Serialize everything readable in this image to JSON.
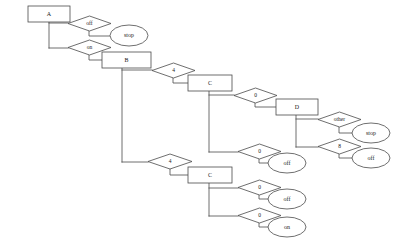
{
  "diagram": {
    "background_color": "#ffffff",
    "stroke_color": "#4a4a4a",
    "text_color": "#1a1a1a",
    "nodes": [
      {
        "id": "n1",
        "name": "process-box-a",
        "shape": "rect",
        "label": "A",
        "x": 28,
        "y": 6,
        "w": 42,
        "h": 16
      },
      {
        "id": "n2",
        "name": "decision-off-1",
        "shape": "diamond",
        "label": "off",
        "x": 68,
        "y": 16,
        "w": 43,
        "h": 15
      },
      {
        "id": "n3",
        "name": "terminal-stop-1",
        "shape": "ellipse",
        "label": "stop",
        "x": 110,
        "y": 25,
        "w": 38,
        "h": 21
      },
      {
        "id": "n4",
        "name": "decision-on-1",
        "shape": "diamond",
        "label": "on",
        "x": 68,
        "y": 40,
        "w": 43,
        "h": 15
      },
      {
        "id": "n5",
        "name": "process-box-b",
        "shape": "rect",
        "label": "B",
        "x": 102,
        "y": 52,
        "w": 49,
        "h": 16
      },
      {
        "id": "n6",
        "name": "decision-4-upper",
        "shape": "diamond",
        "label": "4",
        "x": 152,
        "y": 63,
        "w": 43,
        "h": 15
      },
      {
        "id": "n7",
        "name": "process-box-c-upper",
        "shape": "rect",
        "label": "C",
        "x": 188,
        "y": 75,
        "w": 44,
        "h": 16
      },
      {
        "id": "n8",
        "name": "decision-zero-upper",
        "shape": "diamond",
        "label": "0",
        "x": 234,
        "y": 88,
        "w": 43,
        "h": 15
      },
      {
        "id": "n9",
        "name": "process-box-d",
        "shape": "rect",
        "label": "D",
        "x": 276,
        "y": 99,
        "w": 42,
        "h": 16
      },
      {
        "id": "n10",
        "name": "decision-other",
        "shape": "diamond",
        "label": "other",
        "x": 318,
        "y": 112,
        "w": 43,
        "h": 15
      },
      {
        "id": "n11",
        "name": "terminal-stop-2",
        "shape": "ellipse",
        "label": "stop",
        "x": 352,
        "y": 123,
        "w": 38,
        "h": 20
      },
      {
        "id": "n12",
        "name": "decision-8",
        "shape": "diamond",
        "label": "8",
        "x": 318,
        "y": 139,
        "w": 43,
        "h": 15
      },
      {
        "id": "n13",
        "name": "terminal-off-1",
        "shape": "ellipse",
        "label": "off",
        "x": 352,
        "y": 148,
        "w": 38,
        "h": 20
      },
      {
        "id": "n14",
        "name": "decision-zero-mid",
        "shape": "diamond",
        "label": "0",
        "x": 238,
        "y": 144,
        "w": 43,
        "h": 15
      },
      {
        "id": "n15",
        "name": "terminal-off-2",
        "shape": "ellipse",
        "label": "off",
        "x": 268,
        "y": 153,
        "w": 38,
        "h": 20
      },
      {
        "id": "n16",
        "name": "decision-4-lower",
        "shape": "diamond",
        "label": "4",
        "x": 148,
        "y": 154,
        "w": 44,
        "h": 15
      },
      {
        "id": "n17",
        "name": "process-box-c-lower",
        "shape": "rect",
        "label": "C",
        "x": 188,
        "y": 167,
        "w": 44,
        "h": 16
      },
      {
        "id": "n18",
        "name": "decision-zero-lower-1",
        "shape": "diamond",
        "label": "0",
        "x": 238,
        "y": 180,
        "w": 43,
        "h": 15
      },
      {
        "id": "n19",
        "name": "terminal-off-3",
        "shape": "ellipse",
        "label": "off",
        "x": 268,
        "y": 189,
        "w": 38,
        "h": 20
      },
      {
        "id": "n20",
        "name": "decision-zero-lower-2",
        "shape": "diamond",
        "label": "0",
        "x": 238,
        "y": 208,
        "w": 43,
        "h": 15
      },
      {
        "id": "n21",
        "name": "terminal-on-1",
        "shape": "ellipse",
        "label": "on",
        "x": 268,
        "y": 217,
        "w": 38,
        "h": 20
      }
    ],
    "edges": [
      {
        "name": "edge-a-stem",
        "points": "49,22 49,48"
      },
      {
        "name": "edge-a-to-off1",
        "points": "49,23 68,23"
      },
      {
        "name": "edge-off1-to-stop1",
        "points": "89,31 89,36 110,36"
      },
      {
        "name": "edge-a-to-on1",
        "points": "49,48 68,48"
      },
      {
        "name": "edge-on1-to-b",
        "points": "89,55 89,60 102,60"
      },
      {
        "name": "edge-b-stem",
        "points": "122,68 122,162"
      },
      {
        "name": "edge-b-to-decision4",
        "points": "122,70 152,70"
      },
      {
        "name": "edge-decision4-to-c",
        "points": "173,78 173,83 188,83"
      },
      {
        "name": "edge-c-upper-stem",
        "points": "209,91 209,152"
      },
      {
        "name": "edge-c-to-zero-upper",
        "points": "209,95 234,95"
      },
      {
        "name": "edge-zero-upper-to-d",
        "points": "255,103 255,107 276,107"
      },
      {
        "name": "edge-d-stem",
        "points": "296,115 296,147"
      },
      {
        "name": "edge-d-to-other",
        "points": "296,119 318,119"
      },
      {
        "name": "edge-other-to-stop2",
        "points": "339,127 339,133 352,133"
      },
      {
        "name": "edge-d-to-decision8",
        "points": "296,147 318,147"
      },
      {
        "name": "edge-decision8-to-off1",
        "points": "339,154 339,158 352,158"
      },
      {
        "name": "edge-c-to-zero-mid",
        "points": "209,152 238,152"
      },
      {
        "name": "edge-zero-mid-to-off2",
        "points": "259,159 259,163 268,163"
      },
      {
        "name": "edge-b-to-decision4-low",
        "points": "122,162 148,162"
      },
      {
        "name": "edge-decision4l-to-c",
        "points": "170,169 170,175 188,175"
      },
      {
        "name": "edge-c-lower-stem",
        "points": "209,183 209,216"
      },
      {
        "name": "edge-c-to-zero-low-1",
        "points": "209,188 238,188"
      },
      {
        "name": "edge-zerolow1-to-off3",
        "points": "259,195 259,199 268,199"
      },
      {
        "name": "edge-c-to-zero-low-2",
        "points": "209,216 238,216"
      },
      {
        "name": "edge-zerolow2-to-on1",
        "points": "259,223 259,227 268,227"
      }
    ]
  }
}
